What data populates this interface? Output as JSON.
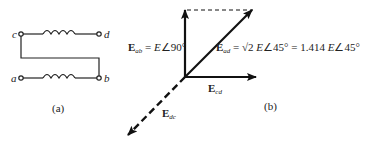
{
  "panel_a": {
    "caption": "(a)",
    "terminals": {
      "c": "c",
      "d": "d",
      "a": "a",
      "b": "b"
    }
  },
  "panel_b": {
    "caption": "(b)",
    "vectors": {
      "E_ab": {
        "symbol": "E",
        "sub": "ab",
        "eq": " = ",
        "value": "E",
        "angle": "∠90°"
      },
      "E_ad": {
        "symbol": "E",
        "sub": "ad",
        "eq": " = √2 ",
        "value": "E",
        "angle": "∠45°",
        "eq2": " = 1.414 ",
        "value2": "E",
        "angle2": "∠45°"
      },
      "E_cd": {
        "symbol": "E",
        "sub": "cd"
      },
      "E_dc": {
        "symbol": "E",
        "sub": "dc"
      }
    }
  },
  "colors": {
    "ink": "#111111",
    "background": "#ffffff"
  }
}
